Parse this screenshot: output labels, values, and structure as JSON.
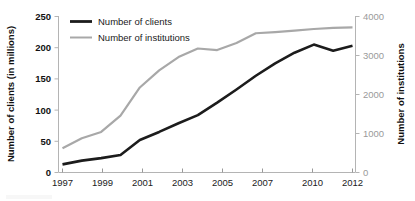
{
  "chart_data": {
    "type": "line",
    "title": "",
    "xlabel": "",
    "ylabel": "Number of clients (in millions)",
    "y2label": "Number of institutions",
    "grid": false,
    "legend_position": "top-left",
    "x": [
      1997,
      1998,
      1999,
      2000,
      2001,
      2002,
      2003,
      2004,
      2005,
      2006,
      2007,
      2008,
      2009,
      2010,
      2011,
      2012
    ],
    "x_tick_labels": [
      "1997",
      "1999",
      "2001",
      "2003",
      "2005",
      "2007",
      "2010",
      "2012"
    ],
    "x_tick_values": [
      1997,
      1999,
      2001,
      2003,
      2005,
      2007,
      2010,
      2012
    ],
    "y_tick_labels": [
      "0",
      "50",
      "100",
      "150",
      "200",
      "250"
    ],
    "y_tick_values": [
      0,
      50,
      100,
      150,
      200,
      250
    ],
    "ylim": [
      0,
      250
    ],
    "y2_tick_labels": [
      "0",
      "1000",
      "2000",
      "3000",
      "4000"
    ],
    "y2_tick_values": [
      0,
      1000,
      2000,
      3000,
      4000
    ],
    "y2lim": [
      0,
      4000
    ],
    "series": [
      {
        "name": "Number of clients",
        "axis": "left",
        "color": "#1c1c1c",
        "values": [
          13,
          19,
          23,
          28,
          52,
          65,
          79,
          92,
          112,
          133,
          155,
          175,
          192,
          205,
          195,
          203
        ]
      },
      {
        "name": "Number of institutions",
        "axis": "right",
        "color": "#a8a8a8",
        "values": [
          620,
          880,
          1040,
          1460,
          2180,
          2620,
          2960,
          3180,
          3140,
          3320,
          3570,
          3600,
          3640,
          3680,
          3710,
          3720
        ]
      }
    ]
  },
  "legend": {
    "items": [
      {
        "label": "Number of clients",
        "color": "#1c1c1c"
      },
      {
        "label": "Number of institutions",
        "color": "#a8a8a8"
      }
    ]
  },
  "axes": {
    "left_title": "Number of clients (in millions)",
    "right_title": "Number of institutions"
  }
}
